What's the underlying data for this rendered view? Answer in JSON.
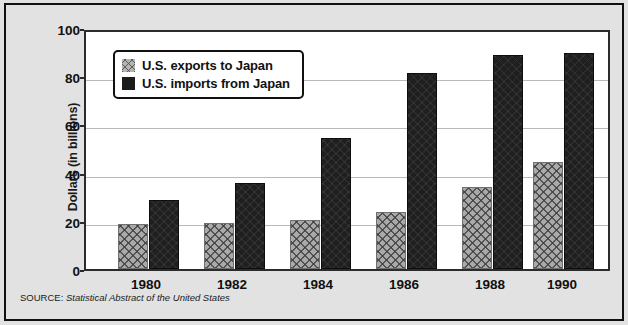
{
  "chart_data": {
    "type": "bar",
    "title": "",
    "subtitle": "",
    "xlabel": "",
    "ylabel": "Dollars (in billions)",
    "categories": [
      "1980",
      "1982",
      "1984",
      "1986",
      "1988",
      "1990"
    ],
    "series": [
      {
        "name": "U.S. exports to Japan",
        "values": [
          18.8,
          19.2,
          20.5,
          23.8,
          34.0,
          44.3
        ],
        "color": "#a9a9a9",
        "pattern": "crosshatch"
      },
      {
        "name": "U.S. imports from Japan",
        "values": [
          28.5,
          35.5,
          54.5,
          81.5,
          88.8,
          89.5
        ],
        "color": "#1f1f1f",
        "pattern": "solid"
      }
    ],
    "ylim": [
      0,
      100
    ],
    "y_ticks": [
      0,
      20,
      40,
      60,
      80,
      100
    ],
    "grid": true,
    "legend_position": "top-left-inside"
  },
  "axes": {
    "y_title": "Dollars (in billions)",
    "y_tick_labels": [
      "0",
      "20",
      "40",
      "60",
      "80",
      "100"
    ],
    "x_tick_labels": [
      "1980",
      "1982",
      "1984",
      "1986",
      "1988",
      "1990"
    ]
  },
  "legend": {
    "entries": [
      {
        "label": "U.S. exports to Japan",
        "swatch": "exports-swatch"
      },
      {
        "label": "U.S. imports from Japan",
        "swatch": "imports-swatch"
      }
    ]
  },
  "source": {
    "label": "SOURCE:",
    "title": "Statistical Abstract of the United States"
  },
  "colors": {
    "page_background": "#e2e2e2",
    "plot_background": "#ffffff",
    "frame": "#111111",
    "gridline": "#b9b9b9",
    "exports": "#a9a9a9",
    "imports": "#1f1f1f"
  }
}
